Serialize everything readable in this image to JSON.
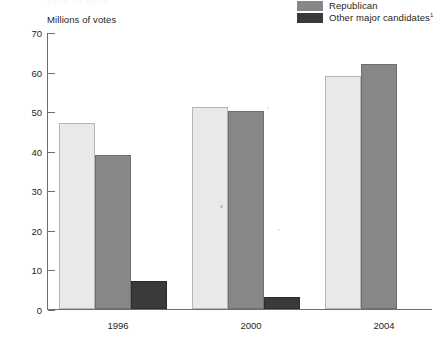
{
  "title_strip": "1996 to 2004",
  "axis_title": "Millions of votes",
  "legend": {
    "items": [
      {
        "label": "Republican",
        "sup": "",
        "color": "#878787",
        "swatch_name": "legend-swatch-republican"
      },
      {
        "label": "Other major candidates",
        "sup": "1",
        "color": "#3a3a3a",
        "swatch_name": "legend-swatch-other"
      }
    ]
  },
  "yticks": [
    "70",
    "60",
    "50",
    "40",
    "30",
    "20",
    "10",
    "0"
  ],
  "xlabels": [
    "1996",
    "2000",
    "2004"
  ],
  "chart_data": {
    "type": "bar",
    "title": "",
    "xlabel": "",
    "ylabel": "Millions of votes",
    "ylim": [
      0,
      70
    ],
    "ytick_step": 10,
    "grid": false,
    "legend_position": "top-right",
    "categories": [
      "1996",
      "2000",
      "2004"
    ],
    "series": [
      {
        "name": "Democratic",
        "color": "#e9e9e7",
        "values": [
          47,
          51,
          59
        ]
      },
      {
        "name": "Republican",
        "color": "#878787",
        "values": [
          39,
          50,
          62
        ]
      },
      {
        "name": "Other major candidates",
        "color": "#3a3a3a",
        "values": [
          7,
          3,
          0
        ]
      }
    ],
    "annotations": [
      "Other major candidates footnote marker: 1"
    ]
  }
}
